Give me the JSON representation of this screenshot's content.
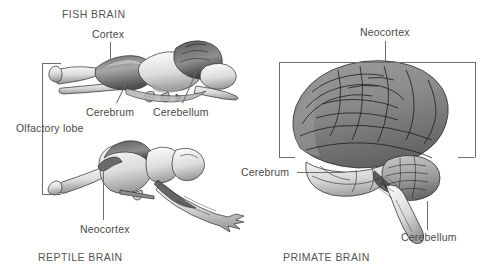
{
  "figure": {
    "background_color": "#ffffff",
    "line_color": "#6d6d6d",
    "text_color": "#4a4a4a"
  },
  "panels": [
    {
      "id": "fish",
      "caption": "FISH BRAIN",
      "caption_position": "top-left",
      "labels": [
        {
          "name": "cortex",
          "text": "Cortex"
        },
        {
          "name": "cerebrum",
          "text": "Cerebrum"
        },
        {
          "name": "cerebellum",
          "text": "Cerebellum"
        }
      ]
    },
    {
      "id": "reptile",
      "caption": "REPTILE BRAIN",
      "caption_position": "bottom-left",
      "labels": [
        {
          "name": "olfactory-lobe",
          "text": "Olfactory lobe"
        },
        {
          "name": "neocortex",
          "text": "Neocortex"
        }
      ]
    },
    {
      "id": "primate",
      "caption": "PRIMATE BRAIN",
      "caption_position": "bottom-left",
      "labels": [
        {
          "name": "neocortex",
          "text": "Neocortex"
        },
        {
          "name": "cerebrum",
          "text": "Cerebrum"
        },
        {
          "name": "cerebellum",
          "text": "Cerebellum"
        }
      ]
    }
  ],
  "fish_panel": {
    "caption": "FISH BRAIN",
    "cortex_label": "Cortex",
    "cerebrum_label": "Cerebrum",
    "cerebellum_label": "Cerebellum"
  },
  "reptile_panel": {
    "caption": "REPTILE BRAIN",
    "olfactory_label": "Olfactory lobe",
    "neocortex_label": "Neocortex"
  },
  "primate_panel": {
    "caption": "PRIMATE BRAIN",
    "neocortex_label": "Neocortex",
    "cerebrum_label": "Cerebrum",
    "cerebellum_label": "Cerebellum"
  }
}
